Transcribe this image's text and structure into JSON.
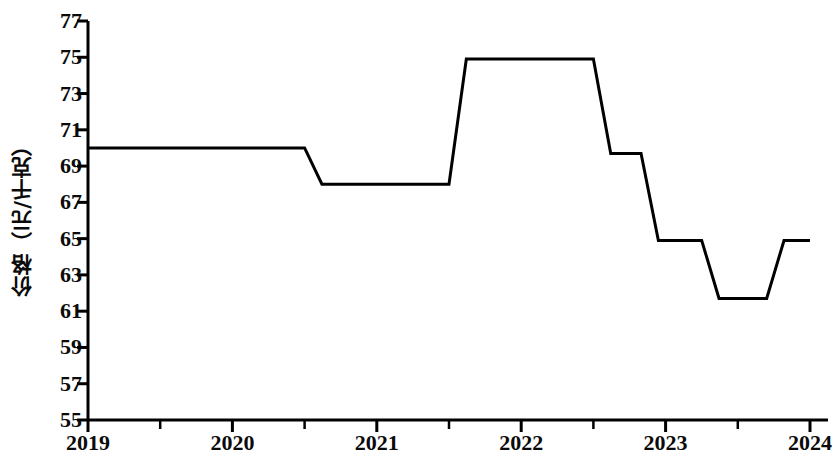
{
  "chart_data": {
    "type": "line",
    "title": "",
    "subtitle": "",
    "xlabel": "",
    "ylabel": "价格（元/千克）",
    "xlim": [
      2019,
      2024
    ],
    "ylim": [
      55,
      77
    ],
    "grid": false,
    "legend": null,
    "x_tick_labels": [
      "2019",
      "2020",
      "2021",
      "2022",
      "2023",
      "2024"
    ],
    "x_tick_values": [
      2019,
      2020,
      2021,
      2022,
      2023,
      2024
    ],
    "x_minor_ticks": [
      2019.5,
      2020.5,
      2021.5,
      2022.5,
      2023.5
    ],
    "y_tick_labels": [
      "55",
      "57",
      "59",
      "61",
      "63",
      "65",
      "67",
      "69",
      "71",
      "73",
      "75",
      "77"
    ],
    "y_tick_values": [
      55,
      57,
      59,
      61,
      63,
      65,
      67,
      69,
      71,
      73,
      75,
      77
    ],
    "line_color": "#000000",
    "line_width": 3,
    "series": [
      {
        "name": "价格",
        "x": [
          2019.0,
          2020.5,
          2020.62,
          2021.5,
          2021.62,
          2022.5,
          2022.62,
          2022.83,
          2022.95,
          2023.25,
          2023.37,
          2023.7,
          2023.82,
          2024.0
        ],
        "values": [
          70.0,
          70.0,
          68.0,
          68.0,
          74.9,
          74.9,
          69.7,
          69.7,
          64.9,
          64.9,
          61.7,
          61.7,
          64.9,
          64.9
        ]
      }
    ],
    "annotations": []
  }
}
